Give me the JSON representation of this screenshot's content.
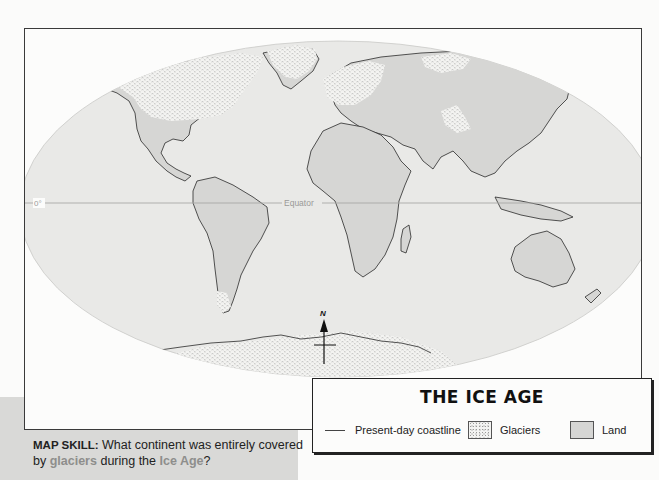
{
  "map": {
    "equator_label": "Equator",
    "zero_label": "0°",
    "north_label": "N",
    "colors": {
      "ocean": "#e9e9e7",
      "land": "#d6d6d4",
      "glacier": "#f2f2f0",
      "coastline": "#2a2a2a",
      "equator_line": "#a8a8a6"
    }
  },
  "legend": {
    "title": "THE ICE AGE",
    "items": [
      {
        "label": "Present-day coastline",
        "symbol": "line"
      },
      {
        "label": "Glaciers",
        "symbol": "stipple-swatch"
      },
      {
        "label": "Land",
        "symbol": "grey-swatch"
      }
    ]
  },
  "map_skill": {
    "label": "MAP SKILL:",
    "text_1": " What continent was entirely covered by ",
    "highlight_1": "glaciers",
    "text_2": " during the ",
    "highlight_2": "Ice Age",
    "text_3": "?"
  }
}
